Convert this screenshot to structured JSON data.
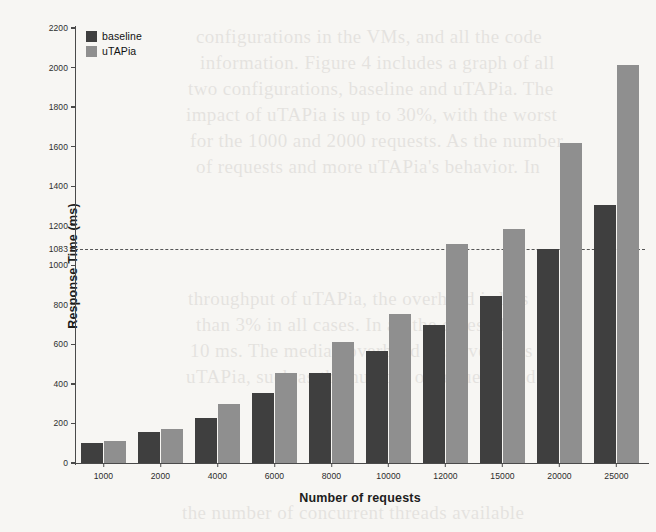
{
  "chart_data": {
    "type": "bar",
    "title": "",
    "xlabel": "Number of requests",
    "ylabel": "Response Time (ms)",
    "categories": [
      "1000",
      "2000",
      "4000",
      "6000",
      "8000",
      "10000",
      "12000",
      "15000",
      "20000",
      "25000"
    ],
    "series": [
      {
        "name": "baseline",
        "color": "#3f3f3f",
        "values": [
          100,
          155,
          230,
          355,
          455,
          565,
          700,
          845,
          1083,
          1305
        ]
      },
      {
        "name": "uTAPia",
        "color": "#8f8f8f",
        "values": [
          110,
          170,
          300,
          455,
          610,
          755,
          1110,
          1185,
          1620,
          2015
        ]
      }
    ],
    "ylim": [
      0,
      2200
    ],
    "yticks": [
      0,
      200,
      400,
      600,
      800,
      1000,
      1083,
      1200,
      1400,
      1600,
      1800,
      2000,
      2200
    ],
    "ytick_labels": [
      "0",
      "200",
      "400",
      "600",
      "800",
      "1000",
      "1083",
      "1200",
      "1400",
      "1600",
      "1800",
      "2000",
      "2200"
    ],
    "grid": false,
    "legend_position": "upper left",
    "annotations": [
      {
        "kind": "threshold-line",
        "value": 1083,
        "label": "1083",
        "style": "dashed",
        "color": "#555555"
      }
    ]
  },
  "legend": {
    "items": [
      {
        "label": "baseline",
        "color": "#3f3f3f"
      },
      {
        "label": "uTAPia",
        "color": "#8f8f8f"
      }
    ]
  },
  "ghost_text": {
    "lines": [
      "configurations in the VMs, and all the code",
      "information. Figure 4 includes a graph of all",
      "two configurations, baseline and uTAPia. The",
      "impact of uTAPia is up to 30%, with the worst",
      "for the 1000 and 2000 requests. As the number",
      "of requests and more uTAPia's behavior. In",
      "throughput of uTAPia, the overhead is less",
      "than 3% in all cases. In all the cases, the",
      "10 ms. The median overhead observed was",
      "uTAPia, such as the number of requests and",
      "the number of concurrent threads available"
    ]
  }
}
